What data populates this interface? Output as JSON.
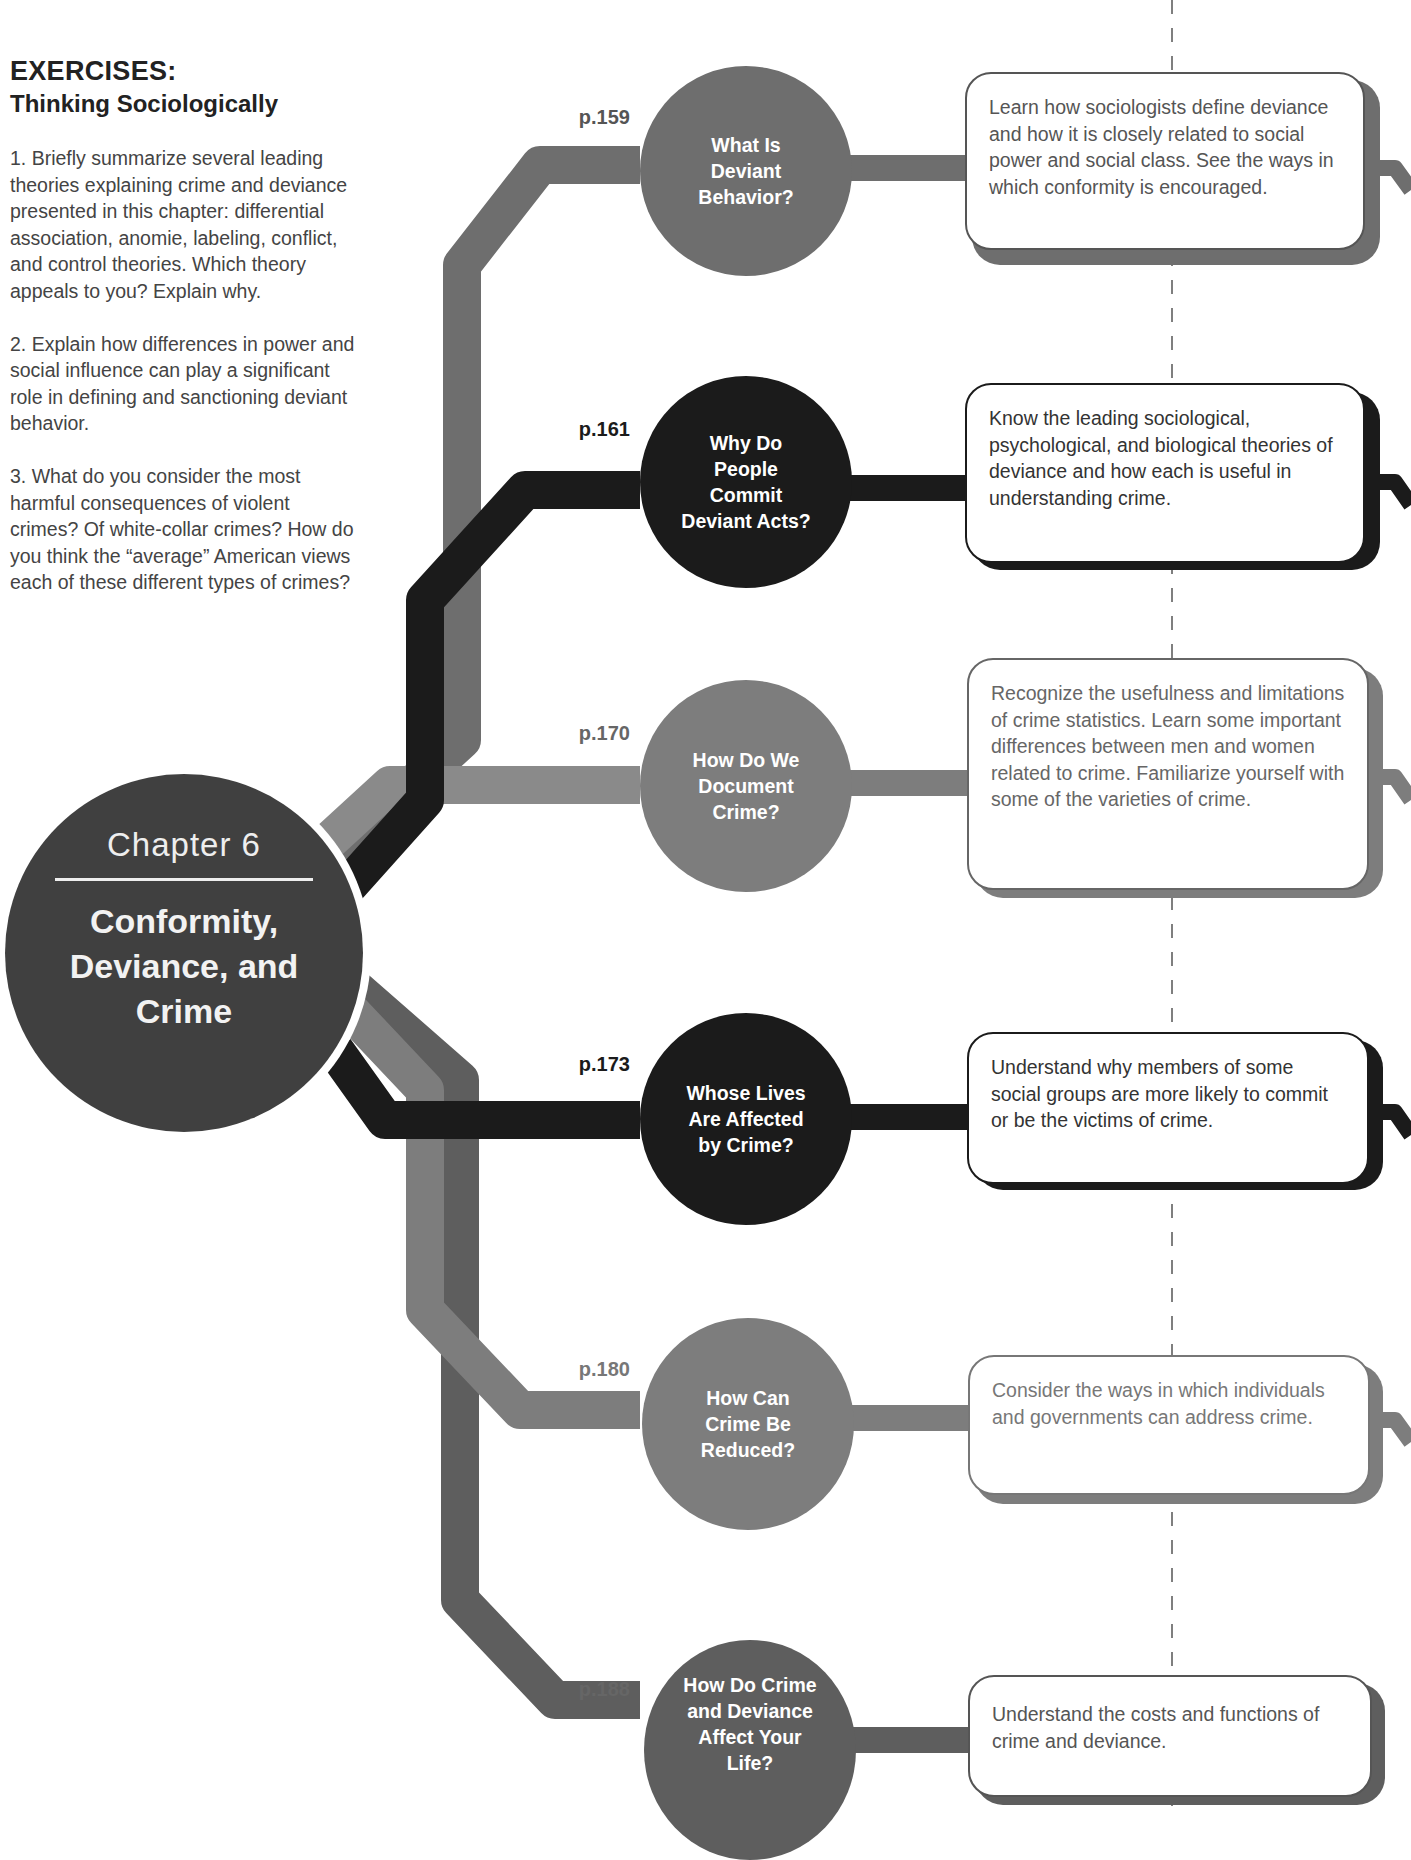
{
  "exercises": {
    "title": "EXERCISES:",
    "subtitle": "Thinking Sociologically",
    "items": [
      "1. Briefly summarize several leading theories explaining crime and deviance presented in this chapter: differential association, anomie, labeling, conflict, and control theories. Which theory appeals to you? Explain why.",
      "2. Explain how differences in power and social influence can play a significant role in defining and sanctioning deviant behavior.",
      "3. What do you consider the most harmful consequences of violent crimes? Of white-collar crimes? How do you think the “average” American views each of these different types of crimes?"
    ]
  },
  "chapter": {
    "number_label": "Chapter 6",
    "title": "Conformity, Deviance, and Crime"
  },
  "colors": {
    "gray": "#7d7d7d",
    "dark_gray": "#5e5e5e",
    "black": "#1b1b1b",
    "chapter_circle": "#404040"
  },
  "sections": [
    {
      "page": "p.159",
      "question": "What Is Deviant Behavior?",
      "objective": "Learn how sociologists define deviance and how it is closely related to social power and social class. See the ways in which conformity is encouraged.",
      "color": "#6e6e6e"
    },
    {
      "page": "p.161",
      "question": "Why Do People Commit Deviant Acts?",
      "objective": "Know the leading sociological, psychological, and biological theories of deviance and how each is useful in understanding crime.",
      "color": "#1b1b1b"
    },
    {
      "page": "p.170",
      "question": "How Do We Document Crime?",
      "objective": "Recognize the usefulness and limitations of crime statistics. Learn some important differences between men and women related to crime. Familiarize yourself with some of the varieties of crime.",
      "color": "#7d7d7d"
    },
    {
      "page": "p.173",
      "question": "Whose Lives Are Affected by Crime?",
      "objective": "Understand why members of some social groups are more likely to commit or be the victims of crime.",
      "color": "#1b1b1b"
    },
    {
      "page": "p.180",
      "question": "How Can Crime Be Reduced?",
      "objective": "Consider the ways in which individuals and governments can address crime.",
      "color": "#7d7d7d"
    },
    {
      "page": "p.188",
      "question": "How Do Crime and Deviance Affect Your Life?",
      "objective": "Understand the costs and functions of crime and deviance.",
      "color": "#5e5e5e"
    }
  ]
}
